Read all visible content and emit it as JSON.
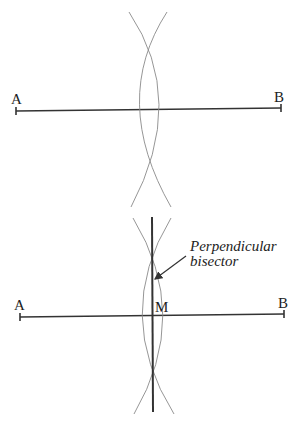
{
  "figures": [
    {
      "id": "step-arcs",
      "labels": {
        "point_a": "A",
        "point_b": "B"
      },
      "segment": {
        "x1": 16,
        "y1": 111,
        "x2": 281,
        "y2": 108
      },
      "arc_intersections": [
        {
          "x": 148,
          "y": 35
        },
        {
          "x": 150,
          "y": 185
        }
      ]
    },
    {
      "id": "step-bisector",
      "labels": {
        "point_a": "A",
        "point_b": "B",
        "midpoint": "M",
        "callout_line1": "Perpendicular",
        "callout_line2": "bisector"
      },
      "segment": {
        "x1": 20,
        "y1": 317,
        "x2": 284,
        "y2": 314
      },
      "bisector": {
        "x1": 152,
        "y1": 217,
        "x2": 153,
        "y2": 412
      },
      "arc_intersections": [
        {
          "x": 152,
          "y": 243
        },
        {
          "x": 153,
          "y": 388
        }
      ]
    }
  ],
  "colors": {
    "line": "#333333",
    "arc": "#8a8a8a",
    "text": "#222222",
    "background": "#ffffff"
  }
}
